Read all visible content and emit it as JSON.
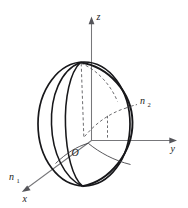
{
  "figure": {
    "kind": "3d-coordinate-sphere-diagram",
    "background_color": "#ffffff",
    "ink_color": "#17171a",
    "axis_color": "#77777a",
    "dashed_color": "#46464a",
    "labels": {
      "axis_z": "z",
      "axis_y": "y",
      "axis_x": "x",
      "origin": "O",
      "normal_1_base": "n",
      "normal_1_sub": "1",
      "normal_2_base": "n",
      "normal_2_sub": "2"
    }
  }
}
